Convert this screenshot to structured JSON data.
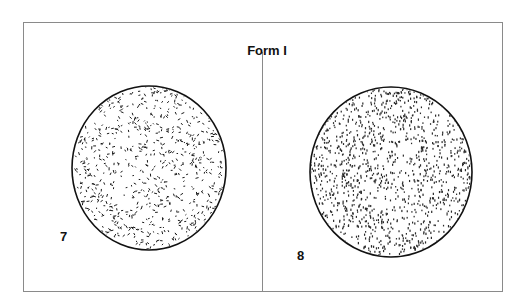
{
  "figure": {
    "title": "Form I",
    "panels": [
      {
        "label": "7",
        "pattern": "dashes",
        "ellipse": {
          "cx": 149,
          "cy": 168,
          "rx": 77,
          "ry": 82
        }
      },
      {
        "label": "8",
        "pattern": "dots",
        "ellipse": {
          "cx": 391,
          "cy": 172,
          "rx": 81,
          "ry": 85
        }
      }
    ],
    "colors": {
      "border": "#8a8a8a",
      "ink": "#111111"
    }
  }
}
